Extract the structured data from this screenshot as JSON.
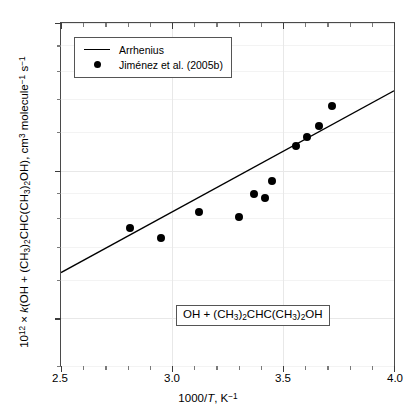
{
  "chart_data": {
    "type": "scatter",
    "title": "",
    "xlabel": "1000/T, K⁻¹",
    "ylabel": "10¹² × k(OH + (CH₃)₂CHC(CH₃)₂OH), cm³ molecule⁻¹ s⁻¹",
    "xlim": [
      2.5,
      4.0
    ],
    "ylim": [
      4.0,
      20.0
    ],
    "yscale": "log",
    "xscale": "linear",
    "grid": true,
    "legend_position": "top-left",
    "xticks": [
      2.5,
      3.0,
      3.5,
      4.0
    ],
    "xtick_labels": [
      "2.5",
      "3.0",
      "3.5",
      "4.0"
    ],
    "xminor_step": 0.1,
    "yticks": [
      20,
      10,
      5
    ],
    "ytick_labels": [
      "20",
      "10",
      "5"
    ],
    "yminor_ticks": [
      18,
      16,
      14,
      12,
      9,
      8,
      7,
      6,
      4
    ],
    "annotation": "OH + (CH3)2CHC(CH3)2OH",
    "series": [
      {
        "name": "Arrhenius",
        "type": "line",
        "style": "solid",
        "color": "#000000",
        "endpoints": [
          [
            2.5,
            6.2
          ],
          [
            4.0,
            14.55
          ]
        ]
      },
      {
        "name": "Jiménez et al. (2005b)",
        "type": "scatter",
        "marker": "filled-circle",
        "color": "#000000",
        "x": [
          2.81,
          2.95,
          3.12,
          3.3,
          3.37,
          3.42,
          3.45,
          3.56,
          3.61,
          3.66,
          3.72
        ],
        "y": [
          7.65,
          7.3,
          8.25,
          8.05,
          8.95,
          8.8,
          9.55,
          11.25,
          11.7,
          12.35,
          13.55
        ]
      }
    ]
  },
  "legend": {
    "items": [
      {
        "label": "Arrhenius",
        "key": "line"
      },
      {
        "label": "Jiménez et al. (2005b)",
        "key": "dot"
      }
    ]
  },
  "axes": {
    "y_title_prefix": "10",
    "y_title_exp": "12",
    "y_title_times": " × ",
    "y_title_k": "k",
    "x_title": "1000/",
    "x_title_T": "T",
    "x_title_unit": ", K"
  },
  "annotation": {
    "text": "OH + (CH3)2CHC(CH3)2OH"
  },
  "colors": {
    "axis": "#4a4a4a",
    "grid": "#e8e8e8",
    "marker": "#000000",
    "line": "#000000",
    "background": "#ffffff"
  }
}
